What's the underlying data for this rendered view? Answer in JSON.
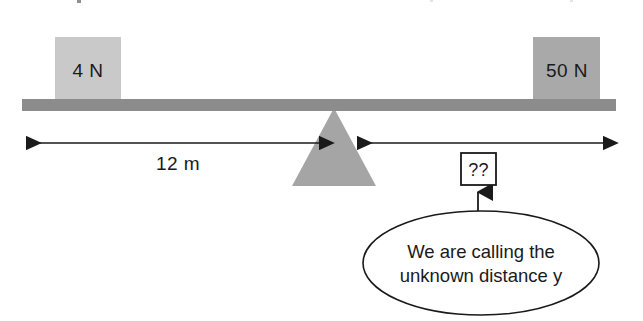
{
  "beam": {
    "name": "beam",
    "color": "#8c8c8c"
  },
  "blocks": [
    {
      "id": "left-weight",
      "label": "4 N",
      "color": "#c9c9c9",
      "side": "left"
    },
    {
      "id": "right-weight",
      "label": "50 N",
      "color": "#a9a9a9",
      "side": "right"
    }
  ],
  "fulcrum": {
    "name": "fulcrum",
    "color": "#a5a5a5"
  },
  "dimensions": [
    {
      "id": "left-distance",
      "label": "12 m",
      "side": "left",
      "value": 12,
      "unit": "m",
      "known": true
    },
    {
      "id": "right-distance",
      "label": "??",
      "side": "right",
      "value": null,
      "unit": "m",
      "known": false
    }
  ],
  "callout": {
    "line1": "We are calling the",
    "line2": "unknown distance y",
    "variable": "y",
    "points_to": "??"
  },
  "colors": {
    "ink": "#1a1a1a",
    "beam": "#8c8c8c",
    "block_light": "#c9c9c9",
    "block_dark": "#a9a9a9",
    "fulcrum": "#a5a5a5",
    "background": "#ffffff"
  }
}
